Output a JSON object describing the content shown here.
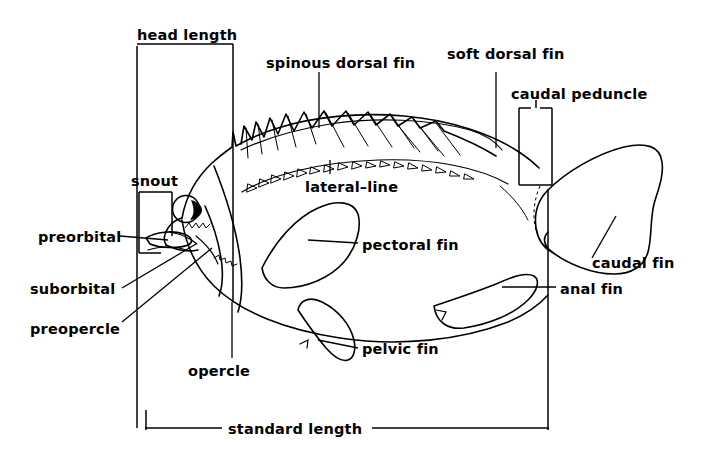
{
  "figure": {
    "background_color": "#ffffff",
    "line_color": "#000000"
  },
  "labels": {
    "head_length": "head length",
    "spinous_dorsal_fin": "spinous dorsal fin",
    "soft_dorsal_fin": "soft dorsal fin",
    "caudal_peduncle": "caudal peduncle",
    "snout": "snout",
    "lateral_line": "lateral–line",
    "preorbital": "preorbital",
    "suborbital": "suborbital",
    "preopercle": "preopercle",
    "opercle": "opercle",
    "pectoral_fin": "pectoral fin",
    "pelvic_fin": "pelvic fin",
    "caudal_fin": "caudal fin",
    "anal_fin": "anal fin",
    "standard_length": "standard length"
  }
}
